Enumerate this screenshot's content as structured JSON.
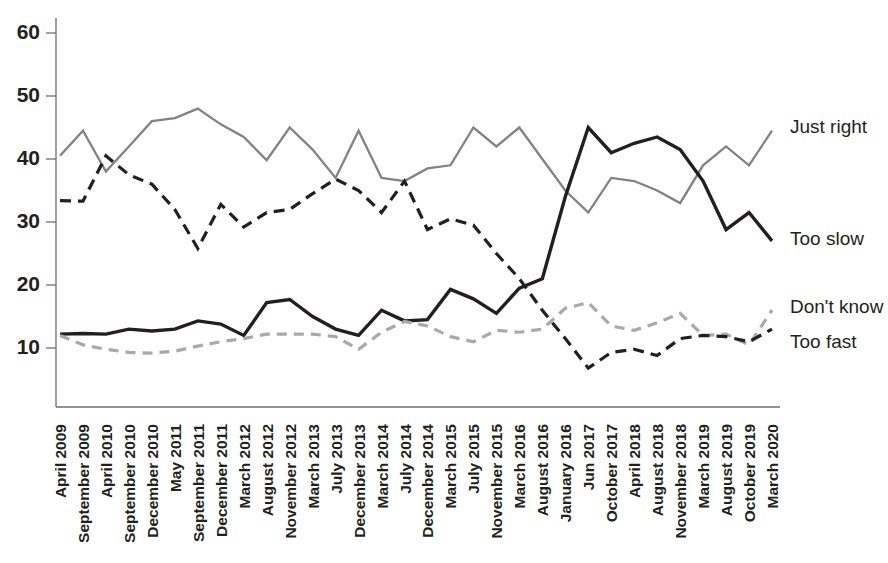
{
  "chart_data": {
    "type": "line",
    "title": "",
    "subtitle": "",
    "xlabel": "",
    "ylabel": "",
    "ylim": [
      0,
      64
    ],
    "y_ticks": [
      10,
      20,
      30,
      40,
      50,
      60
    ],
    "grid": false,
    "legend_position": "right-inline",
    "categories": [
      "April 2009",
      "September 2009",
      "April 2010",
      "September 2010",
      "December 2010",
      "May 2011",
      "September 2011",
      "December 2011",
      "March 2012",
      "August 2012",
      "November 2012",
      "March 2013",
      "July 2013",
      "December 2013",
      "March 2014",
      "July 2014",
      "December 2014",
      "March 2015",
      "July 2015",
      "November 2015",
      "March 2016",
      "August 2016",
      "January 2016",
      "Jun 2017",
      "October 2017",
      "April 2018",
      "August 2018",
      "November 2018",
      "March 2019",
      "August 2019",
      "October 2019",
      "March 2020"
    ],
    "series": [
      {
        "name": "Just right",
        "color": "#808285",
        "style": "solid",
        "values": [
          40.5,
          44.5,
          38.0,
          42.0,
          46.0,
          46.5,
          48.0,
          45.5,
          43.5,
          39.8,
          45.0,
          41.5,
          37.0,
          44.5,
          37.0,
          36.5,
          38.5,
          39.0,
          45.0,
          42.0,
          45.0,
          40.0,
          35.0,
          31.5,
          37.0,
          36.5,
          35.0,
          33.0,
          39.0,
          42.0,
          39.0,
          44.5
        ]
      },
      {
        "name": "Too slow",
        "color": "#231f20",
        "style": "solid",
        "values": [
          12.2,
          12.3,
          12.2,
          13.0,
          12.7,
          13.0,
          14.3,
          13.8,
          12.0,
          17.2,
          17.7,
          15.0,
          13.0,
          12.0,
          16.0,
          14.3,
          14.5,
          19.3,
          17.8,
          15.5,
          19.5,
          21.0,
          34.0,
          45.0,
          41.0,
          42.5,
          43.5,
          41.5,
          36.5,
          28.8,
          31.5,
          27.0
        ]
      },
      {
        "name": "Don't know",
        "color": "#a7a9ac",
        "style": "dashed",
        "values": [
          12.0,
          10.5,
          9.8,
          9.3,
          9.2,
          9.5,
          10.3,
          11.0,
          11.5,
          12.2,
          12.2,
          12.2,
          11.8,
          9.8,
          12.5,
          14.2,
          13.5,
          11.8,
          11.0,
          12.8,
          12.5,
          13.0,
          16.3,
          17.2,
          13.5,
          12.8,
          14.0,
          15.5,
          12.0,
          12.2,
          10.5,
          16.0
        ]
      },
      {
        "name": "Too fast",
        "color": "#231f20",
        "style": "dashed",
        "values": [
          33.4,
          33.3,
          40.5,
          37.5,
          36.0,
          32.0,
          25.8,
          32.8,
          29.2,
          31.5,
          32.0,
          34.5,
          36.8,
          35.0,
          31.5,
          36.5,
          28.8,
          30.5,
          29.5,
          25.0,
          21.0,
          16.0,
          11.5,
          6.8,
          9.3,
          9.8,
          8.8,
          11.5,
          12.0,
          11.8,
          11.0,
          13.0
        ]
      }
    ]
  }
}
